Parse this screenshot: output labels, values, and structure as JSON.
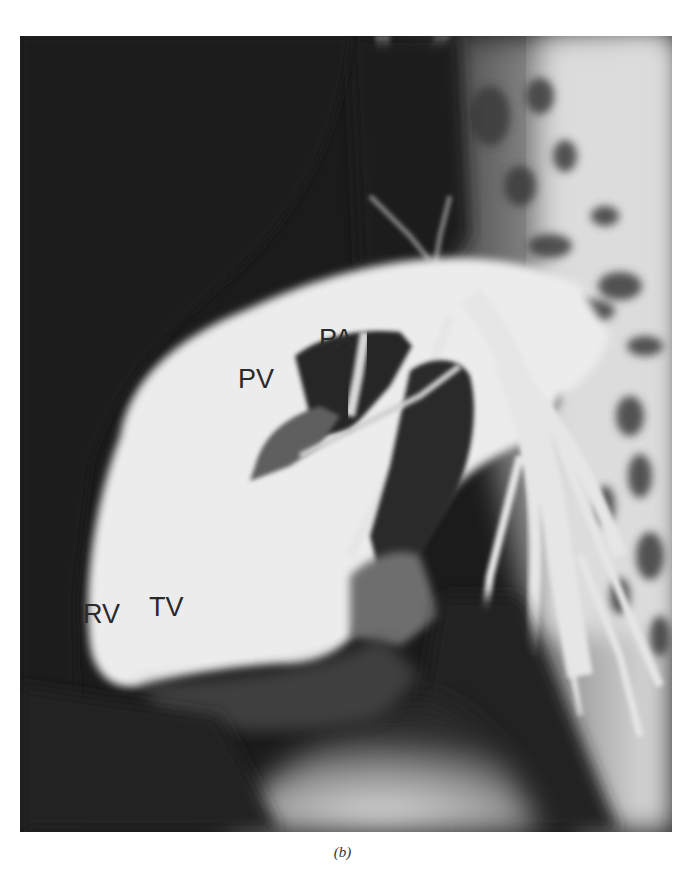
{
  "figure": {
    "caption": "(b)",
    "labels": {
      "pa": "PA",
      "pv": "PV",
      "rv": "RV",
      "tv": "TV"
    },
    "colors": {
      "background": "#1a1a1a",
      "contrast_fill": "#ececec",
      "label_text": "#2a2a2a"
    }
  }
}
